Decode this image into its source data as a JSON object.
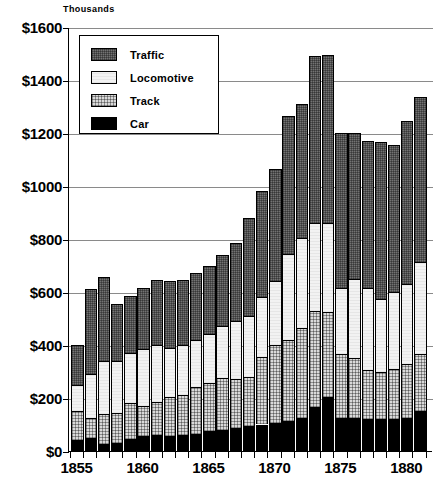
{
  "axis": {
    "unit_label": "Thousands",
    "y_ticks": [
      "$0",
      "$200",
      "$400",
      "$600",
      "$800",
      "$1000",
      "$1200",
      "$1400",
      "$1600"
    ],
    "x_ticks": [
      "1855",
      "1860",
      "1865",
      "1870",
      "1875",
      "1880"
    ]
  },
  "legend": {
    "items": [
      {
        "label": "Traffic",
        "color": "#737373",
        "swatch": "traffic-swatch"
      },
      {
        "label": "Locomotive",
        "color": "#f2f2f2",
        "swatch": "locomotive-swatch"
      },
      {
        "label": "Track",
        "color": "#d9d9d9",
        "swatch": "track-swatch"
      },
      {
        "label": "Car",
        "color": "#000000",
        "swatch": "car-swatch"
      }
    ]
  },
  "chart_data": {
    "type": "bar",
    "stacked": true,
    "title": "",
    "subtitle": "",
    "xlabel": "",
    "ylabel": "Thousands",
    "ylim": [
      0,
      1600
    ],
    "ytick_step": 200,
    "grid": true,
    "legend_position": "top-left",
    "currency_prefix": "$",
    "categories": [
      1855,
      1856,
      1857,
      1858,
      1859,
      1860,
      1861,
      1862,
      1863,
      1864,
      1865,
      1866,
      1867,
      1868,
      1869,
      1870,
      1871,
      1872,
      1873,
      1874,
      1875,
      1876,
      1877,
      1878,
      1879,
      1880,
      1881
    ],
    "series": [
      {
        "name": "Car",
        "color": "#000000",
        "values": [
          40,
          50,
          25,
          30,
          45,
          55,
          60,
          55,
          60,
          65,
          75,
          80,
          85,
          95,
          100,
          105,
          115,
          125,
          165,
          205,
          125,
          125,
          120,
          120,
          120,
          125,
          150
        ]
      },
      {
        "name": "Track",
        "color": "#d9d9d9",
        "values": [
          110,
          75,
          115,
          115,
          135,
          115,
          125,
          150,
          150,
          175,
          180,
          195,
          185,
          185,
          255,
          295,
          305,
          340,
          365,
          320,
          240,
          225,
          185,
          180,
          190,
          205,
          215
        ]
      },
      {
        "name": "Locomotive",
        "color": "#f2f2f2",
        "values": [
          100,
          165,
          200,
          195,
          190,
          215,
          215,
          185,
          190,
          180,
          185,
          195,
          220,
          230,
          225,
          240,
          325,
          340,
          330,
          335,
          250,
          300,
          310,
          275,
          290,
          300,
          350
        ]
      },
      {
        "name": "Traffic",
        "color": "#737373",
        "values": [
          150,
          320,
          315,
          215,
          215,
          230,
          245,
          250,
          245,
          250,
          260,
          270,
          295,
          370,
          400,
          425,
          520,
          505,
          630,
          635,
          585,
          550,
          555,
          590,
          555,
          615,
          620
        ]
      }
    ],
    "totals": [
      400,
      610,
      655,
      555,
      585,
      615,
      645,
      640,
      645,
      670,
      700,
      740,
      785,
      880,
      980,
      1065,
      1265,
      1310,
      1490,
      1495,
      1200,
      1200,
      1170,
      1165,
      1155,
      1245,
      1335
    ]
  }
}
